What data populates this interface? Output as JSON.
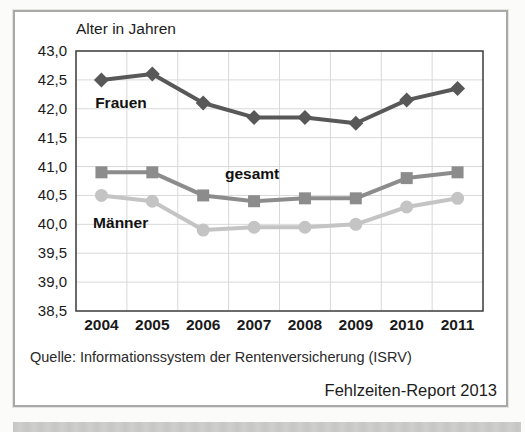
{
  "figure": {
    "source": "Quelle: Informationssystem der Rentenversicherung (ISRV)",
    "credit": "Fehlzeiten-Report 2013"
  },
  "chart_data": {
    "type": "line",
    "title": "Alter in Jahren",
    "categories": [
      "2004",
      "2005",
      "2006",
      "2007",
      "2008",
      "2009",
      "2010",
      "2011"
    ],
    "series": [
      {
        "key": "frauen",
        "name": "Frauen",
        "color": "#585858",
        "marker": "diamond",
        "values": [
          42.5,
          42.6,
          42.1,
          41.85,
          41.85,
          41.75,
          42.15,
          42.35
        ]
      },
      {
        "key": "gesamt",
        "name": "gesamt",
        "color": "#8c8c8c",
        "marker": "square",
        "values": [
          40.9,
          40.9,
          40.5,
          40.4,
          40.45,
          40.45,
          40.8,
          40.9
        ]
      },
      {
        "key": "maenner",
        "name": "Männer",
        "color": "#c4c4c4",
        "marker": "circle",
        "values": [
          40.5,
          40.4,
          39.9,
          39.95,
          39.95,
          40.0,
          40.3,
          40.45
        ]
      }
    ],
    "ylim": [
      38.5,
      43.0
    ],
    "ytick_step": 0.5,
    "ytick_labels": [
      "43,0",
      "42,5",
      "42,0",
      "41,5",
      "41,0",
      "40,5",
      "40,0",
      "39,5",
      "39,0",
      "38,5"
    ],
    "xlabel": "",
    "ylabel": "Alter in Jahren",
    "grid": true,
    "legend": "inline-labels",
    "annotations": [
      {
        "text": "Frauen",
        "x_pct": 4.7,
        "y_pct": 20.4
      },
      {
        "text": "gesamt",
        "x_pct": 36.6,
        "y_pct": 47.7
      },
      {
        "text": "Männer",
        "x_pct": 4.2,
        "y_pct": 66.5
      }
    ],
    "colors": {
      "grid": "#d8d8d8",
      "axis": "#3a3a3a",
      "text": "#1a1a1a"
    }
  }
}
